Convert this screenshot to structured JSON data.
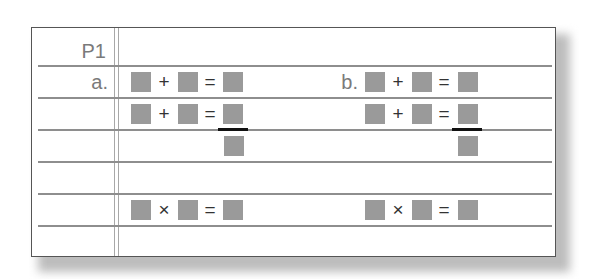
{
  "worksheet": {
    "header_label": "P1",
    "colors": {
      "placeholder_square": "#9a9a9a",
      "border": "#555555",
      "rule_line": "#8e8e8e",
      "label_text": "#7a7a7a",
      "operator_text": "#333333",
      "carry_bar": "#111111"
    },
    "problems": [
      {
        "label": "a.",
        "line1": {
          "op": "+",
          "eq": "="
        },
        "line2": {
          "op": "+",
          "eq": "="
        },
        "line3": {
          "op": "×",
          "eq": "="
        }
      },
      {
        "label": "b.",
        "line1": {
          "op": "+",
          "eq": "="
        },
        "line2": {
          "op": "+",
          "eq": "="
        },
        "line3": {
          "op": "×",
          "eq": "="
        }
      }
    ]
  }
}
